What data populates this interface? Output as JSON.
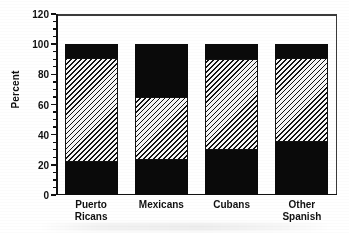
{
  "chart_data": {
    "type": "bar",
    "stacked": true,
    "title": "",
    "xlabel": "",
    "ylabel": "Percent",
    "ylim": [
      0,
      120
    ],
    "ytick_values": [
      0,
      20,
      40,
      60,
      80,
      100,
      120
    ],
    "ytick_labels": [
      "0",
      "20",
      "40",
      "60",
      "80",
      "100",
      "120"
    ],
    "yminor_interval": 5,
    "grid": false,
    "legend": "none",
    "categories": [
      "Puerto\nRicans",
      "Mexicans",
      "Cubans",
      "Other\nSpanish"
    ],
    "series": [
      {
        "name": "bottom-segment",
        "fill": "solid-black",
        "values": [
          22,
          23,
          30,
          35
        ]
      },
      {
        "name": "middle-segment",
        "fill": "diagonal-hatch",
        "values": [
          69,
          42,
          60,
          56
        ]
      },
      {
        "name": "top-segment",
        "fill": "solid-black",
        "values": [
          9,
          35,
          10,
          9
        ]
      }
    ],
    "totals": [
      100,
      100,
      100,
      100
    ],
    "colors": {
      "solid": "#0a0a0a",
      "hatch_line": "#111111",
      "hatch_bg": "#f4f4f4",
      "axis": "#111111",
      "frame": "#3a3a3a"
    }
  }
}
